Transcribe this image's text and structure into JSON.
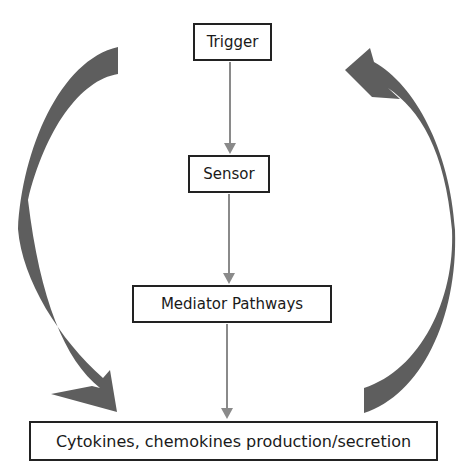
{
  "diagram": {
    "nodes": [
      {
        "id": "trigger",
        "label": "Trigger"
      },
      {
        "id": "sensor",
        "label": "Sensor"
      },
      {
        "id": "mediator",
        "label": "Mediator Pathways"
      },
      {
        "id": "cytokines",
        "label": "Cytokines, chemokines production/secretion"
      }
    ],
    "edges": [
      {
        "from": "trigger",
        "to": "sensor",
        "style": "thin-arrow"
      },
      {
        "from": "sensor",
        "to": "mediator",
        "style": "thin-arrow"
      },
      {
        "from": "mediator",
        "to": "cytokines",
        "style": "thin-arrow"
      },
      {
        "from": "trigger",
        "to": "cytokines",
        "style": "curved-thick-arrow",
        "side": "left"
      },
      {
        "from": "cytokines",
        "to": "trigger",
        "style": "curved-thick-arrow",
        "side": "right"
      }
    ],
    "colors": {
      "box_border": "#222222",
      "thin_arrow": "#8a8a8a",
      "thick_arrow": "#5e5e5e"
    }
  }
}
